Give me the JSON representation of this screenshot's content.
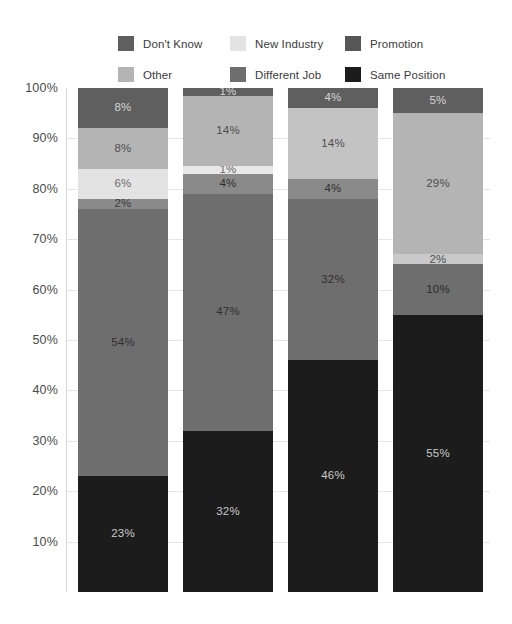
{
  "chart_data": {
    "type": "bar",
    "subtype": "stacked-100-percent",
    "title": "",
    "xlabel": "",
    "ylabel": "",
    "ylim": [
      0,
      100
    ],
    "grid": true,
    "legend_position": "top",
    "ytick_labels": [
      "100%",
      "90%",
      "80%",
      "70%",
      "60%",
      "50%",
      "40%",
      "30%",
      "20%",
      "10%"
    ],
    "ytick_values": [
      100,
      90,
      80,
      70,
      60,
      50,
      40,
      30,
      20,
      10
    ],
    "categories": [
      "Bar 1",
      "Bar 2",
      "Bar 3",
      "Bar 4"
    ],
    "stack_order_bottom_to_top": [
      "Same Position",
      "Promotion",
      "Different Job",
      "New Industry",
      "Other",
      "Don't Know"
    ],
    "series": [
      {
        "name": "Same Position",
        "color": "#1c1c1c",
        "label_color": "#c9c9c9",
        "values": [
          23,
          32,
          46,
          55
        ]
      },
      {
        "name": "Promotion",
        "color": "#575757",
        "label_color": "#d0d0d0",
        "values": [
          2,
          4,
          4,
          10
        ]
      },
      {
        "name": "Different Job",
        "color": "#6e6e6e",
        "label_color": "#2e2e2e",
        "values": [
          54,
          47,
          32,
          0
        ]
      },
      {
        "name": "New Industry",
        "color": "#e3e3e3",
        "label_color": "#6b6b6b",
        "values": [
          6,
          1,
          0,
          2
        ]
      },
      {
        "name": "Other",
        "color": "#b4b4b4",
        "label_color": "#4e4e4e",
        "values": [
          8,
          0,
          14,
          29
        ]
      },
      {
        "name": "Don't Know",
        "color": "#5f5f5f",
        "label_color": "#d5d5d5",
        "values": [
          8,
          14,
          4,
          5
        ]
      }
    ],
    "bar_segment_labels": [
      [
        "8%",
        "8%",
        "6%",
        "2%",
        "54%",
        "23%"
      ],
      [
        "1%",
        "14%",
        "1%",
        "4%",
        "47%",
        "32%"
      ],
      [
        "4%",
        "14%",
        "4%",
        "32%",
        "46%"
      ],
      [
        "5%",
        "29%",
        "2%",
        "10%",
        "55%"
      ]
    ]
  },
  "legend": {
    "items": [
      {
        "label": "Don't Know",
        "color": "#5f5f5f"
      },
      {
        "label": "New Industry",
        "color": "#e3e3e3"
      },
      {
        "label": "Promotion",
        "color": "#575757"
      },
      {
        "label": "Other",
        "color": "#b4b4b4"
      },
      {
        "label": "Different Job",
        "color": "#6e6e6e"
      },
      {
        "label": "Same Position",
        "color": "#1c1c1c"
      }
    ]
  },
  "bars": [
    {
      "name": "bar-1",
      "segments": [
        {
          "series": "Don't Know",
          "value": 8,
          "label": "8%",
          "color": "#5f5f5f",
          "label_color": "#d5d5d5"
        },
        {
          "series": "Other",
          "value": 8,
          "label": "8%",
          "color": "#b4b4b4",
          "label_color": "#4e4e4e"
        },
        {
          "series": "New Industry",
          "value": 6,
          "label": "6%",
          "color": "#e3e3e3",
          "label_color": "#6b6b6b"
        },
        {
          "series": "Promotion",
          "value": 2,
          "label": "2%",
          "color": "#8a8a8a",
          "label_color": "#3a3a3a"
        },
        {
          "series": "Different Job",
          "value": 53,
          "label": "54%",
          "color": "#6e6e6e",
          "label_color": "#2e2e2e"
        },
        {
          "series": "Same Position",
          "value": 23,
          "label": "23%",
          "color": "#1c1c1c",
          "label_color": "#c9c9c9"
        }
      ]
    },
    {
      "name": "bar-2",
      "segments": [
        {
          "series": "Don't Know",
          "value": 1.5,
          "label": "1%",
          "color": "#5f5f5f",
          "label_color": "#d5d5d5"
        },
        {
          "series": "Other",
          "value": 14,
          "label": "14%",
          "color": "#b4b4b4",
          "label_color": "#4e4e4e"
        },
        {
          "series": "New Industry",
          "value": 1.5,
          "label": "1%",
          "color": "#e8e8e8",
          "label_color": "#6b6b6b"
        },
        {
          "series": "Promotion",
          "value": 4,
          "label": "4%",
          "color": "#8a8a8a",
          "label_color": "#2e2e2e"
        },
        {
          "series": "Different Job",
          "value": 47,
          "label": "47%",
          "color": "#6e6e6e",
          "label_color": "#2e2e2e"
        },
        {
          "series": "Same Position",
          "value": 32,
          "label": "32%",
          "color": "#1c1c1c",
          "label_color": "#c9c9c9"
        }
      ]
    },
    {
      "name": "bar-3",
      "segments": [
        {
          "series": "Don't Know",
          "value": 4,
          "label": "4%",
          "color": "#5f5f5f",
          "label_color": "#d5d5d5"
        },
        {
          "series": "Other",
          "value": 14,
          "label": "14%",
          "color": "#c3c3c3",
          "label_color": "#4e4e4e"
        },
        {
          "series": "Promotion",
          "value": 4,
          "label": "4%",
          "color": "#8a8a8a",
          "label_color": "#2e2e2e"
        },
        {
          "series": "Different Job",
          "value": 32,
          "label": "32%",
          "color": "#6e6e6e",
          "label_color": "#2e2e2e"
        },
        {
          "series": "Same Position",
          "value": 46,
          "label": "46%",
          "color": "#1c1c1c",
          "label_color": "#c9c9c9"
        }
      ]
    },
    {
      "name": "bar-4",
      "segments": [
        {
          "series": "Don't Know",
          "value": 5,
          "label": "5%",
          "color": "#5f5f5f",
          "label_color": "#d5d5d5"
        },
        {
          "series": "Other",
          "value": 28,
          "label": "29%",
          "color": "#b4b4b4",
          "label_color": "#4e4e4e"
        },
        {
          "series": "New Industry",
          "value": 2,
          "label": "2%",
          "color": "#c9c9c9",
          "label_color": "#4e4e4e"
        },
        {
          "series": "Promotion",
          "value": 10,
          "label": "10%",
          "color": "#6e6e6e",
          "label_color": "#2b2b2b"
        },
        {
          "series": "Same Position",
          "value": 55,
          "label": "55%",
          "color": "#1c1c1c",
          "label_color": "#c9c9c9"
        }
      ]
    }
  ]
}
